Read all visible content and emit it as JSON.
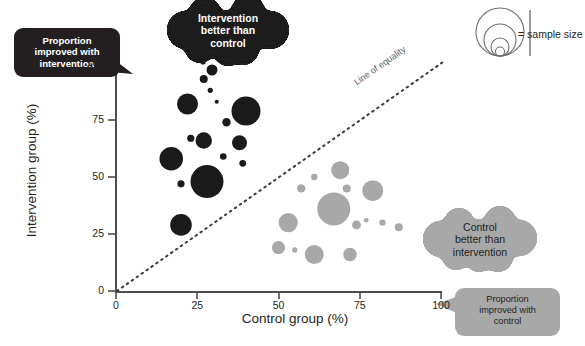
{
  "chart_data": {
    "type": "scatter",
    "title": "",
    "xlabel": "Control group (%)",
    "ylabel": "Intervention group (%)",
    "xlim": [
      0,
      100
    ],
    "ylim": [
      0,
      100
    ],
    "xticks": [
      0,
      25,
      50,
      75,
      100
    ],
    "yticks": [
      0,
      25,
      50,
      75,
      100
    ],
    "grid": false,
    "size_encoding": "sample size",
    "reference_line": {
      "label": "Line of equality",
      "from": [
        0,
        0
      ],
      "to": [
        100,
        100
      ],
      "style": "dotted"
    },
    "series": [
      {
        "name": "Intervention better than control",
        "color": "#1a1a1a",
        "points": [
          {
            "x": 27,
            "y": 93,
            "r": 4.0
          },
          {
            "x": 29,
            "y": 88,
            "r": 2.6
          },
          {
            "x": 22,
            "y": 82,
            "r": 10.5
          },
          {
            "x": 31,
            "y": 83,
            "r": 2.0
          },
          {
            "x": 40,
            "y": 79,
            "r": 14.5
          },
          {
            "x": 34,
            "y": 74,
            "r": 4.2
          },
          {
            "x": 27,
            "y": 66,
            "r": 8.2
          },
          {
            "x": 38,
            "y": 65,
            "r": 7.5
          },
          {
            "x": 23,
            "y": 67,
            "r": 3.6
          },
          {
            "x": 17,
            "y": 58,
            "r": 11.8
          },
          {
            "x": 33,
            "y": 59,
            "r": 3.3
          },
          {
            "x": 39,
            "y": 56,
            "r": 3.4
          },
          {
            "x": 28,
            "y": 48,
            "r": 16.5
          },
          {
            "x": 20,
            "y": 47,
            "r": 3.6
          },
          {
            "x": 20,
            "y": 29,
            "r": 10.8
          }
        ]
      },
      {
        "name": "Control better than intervention",
        "color": "#a8a8a8",
        "points": [
          {
            "x": 69,
            "y": 53,
            "r": 9.0
          },
          {
            "x": 61,
            "y": 50,
            "r": 3.2
          },
          {
            "x": 79,
            "y": 44,
            "r": 10.5
          },
          {
            "x": 71,
            "y": 45,
            "r": 4.0
          },
          {
            "x": 57,
            "y": 45,
            "r": 4.2
          },
          {
            "x": 67,
            "y": 36,
            "r": 16.5
          },
          {
            "x": 53,
            "y": 30,
            "r": 9.6
          },
          {
            "x": 77,
            "y": 31,
            "r": 2.3
          },
          {
            "x": 82,
            "y": 30,
            "r": 3.2
          },
          {
            "x": 87,
            "y": 28,
            "r": 4.0
          },
          {
            "x": 74,
            "y": 29,
            "r": 4.4
          },
          {
            "x": 50,
            "y": 19,
            "r": 6.6
          },
          {
            "x": 55,
            "y": 18,
            "r": 2.6
          },
          {
            "x": 61,
            "y": 16,
            "r": 9.4
          },
          {
            "x": 72,
            "y": 16,
            "r": 6.8
          }
        ]
      }
    ]
  },
  "callouts": {
    "left": {
      "lines": [
        "Proportion",
        "improved with",
        "intervention"
      ],
      "style": "dark"
    },
    "top": {
      "lines": [
        "Intervention",
        "better than",
        "control"
      ],
      "style": "dark"
    },
    "right": {
      "lines": [
        "Control",
        "better than",
        "intervention"
      ],
      "style": "light"
    },
    "bottom_right": {
      "lines": [
        "Proportion",
        "improved with",
        "control"
      ],
      "style": "light"
    }
  },
  "legend": {
    "label": "= sample size",
    "circle_count": 4
  },
  "colors": {
    "dark": "#1a1a1a",
    "light": "#a8a8a8",
    "axis": "#4d4d4d",
    "text": "#231f20"
  }
}
